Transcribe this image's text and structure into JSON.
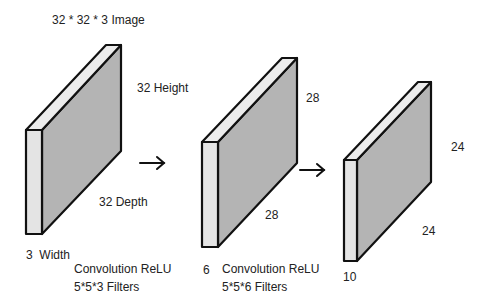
{
  "title": "32 * 32 * 3 Image",
  "colors": {
    "front_face": "#e4e4e4",
    "side_face": "#b4b4b4",
    "top_face": "#ececec",
    "stroke": "#111111",
    "text": "#222222"
  },
  "volumes": [
    {
      "name": "input-image",
      "height_label": "32 Height",
      "depth_label": "32 Depth",
      "width_label": "3  Width"
    },
    {
      "name": "conv1-output",
      "height_label": "28",
      "depth_label": "28",
      "width_label": "6"
    },
    {
      "name": "conv2-output",
      "height_label": "24",
      "depth_label": "24",
      "width_label": "10"
    }
  ],
  "operations": [
    {
      "line1": "Convolution ReLU",
      "line2": "5*5*3 Filters"
    },
    {
      "line1": "Convolution ReLU",
      "line2": "5*5*6 Filters"
    }
  ]
}
